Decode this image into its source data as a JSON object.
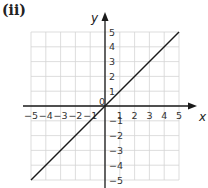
{
  "part_label": "(ii)",
  "chart_data": {
    "type": "line",
    "title": "(ii)",
    "xlabel": "x",
    "ylabel": "y",
    "xlim": [
      -5,
      5
    ],
    "ylim": [
      -5,
      5
    ],
    "grid": true,
    "x_ticks": [
      -5,
      -4,
      -3,
      -2,
      -1,
      1,
      2,
      3,
      4,
      5
    ],
    "y_ticks": [
      5,
      4,
      3,
      2,
      1,
      -1,
      -2,
      -3,
      -4,
      -5
    ],
    "origin_label": "0",
    "series": [
      {
        "name": "y = x",
        "x": [
          -5,
          5
        ],
        "y": [
          -5,
          5
        ],
        "color": "#1a1a1a"
      }
    ]
  },
  "colors": {
    "grid": "#d4d4d4",
    "axis": "#1a1a1a",
    "line": "#1a1a1a"
  }
}
